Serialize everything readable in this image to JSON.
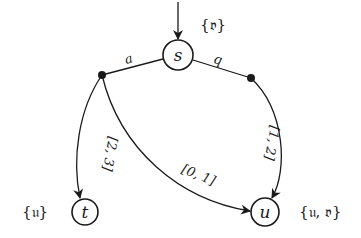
{
  "diagram": {
    "type": "timed automaton / transition system",
    "colors": {
      "stroke": "#1a1a1a",
      "background": "#ffffff"
    },
    "nodes": [
      {
        "id": "s",
        "label": "s",
        "set_label": "{𝔳}",
        "initial": true
      },
      {
        "id": "t",
        "label": "t",
        "set_label": "{𝔲}",
        "initial": false
      },
      {
        "id": "u",
        "label": "u",
        "set_label": "{𝔲, 𝔳}",
        "initial": false
      }
    ],
    "actions": [
      {
        "id": "a",
        "label": "a",
        "from": "s"
      },
      {
        "id": "b",
        "label": "b",
        "from": "s"
      }
    ],
    "edges": [
      {
        "from": "a",
        "to": "t",
        "label": "[2, 3]"
      },
      {
        "from": "a",
        "to": "u",
        "label": "[0, 1]"
      },
      {
        "from": "b",
        "to": "u",
        "label": "[1, 2]"
      }
    ]
  }
}
